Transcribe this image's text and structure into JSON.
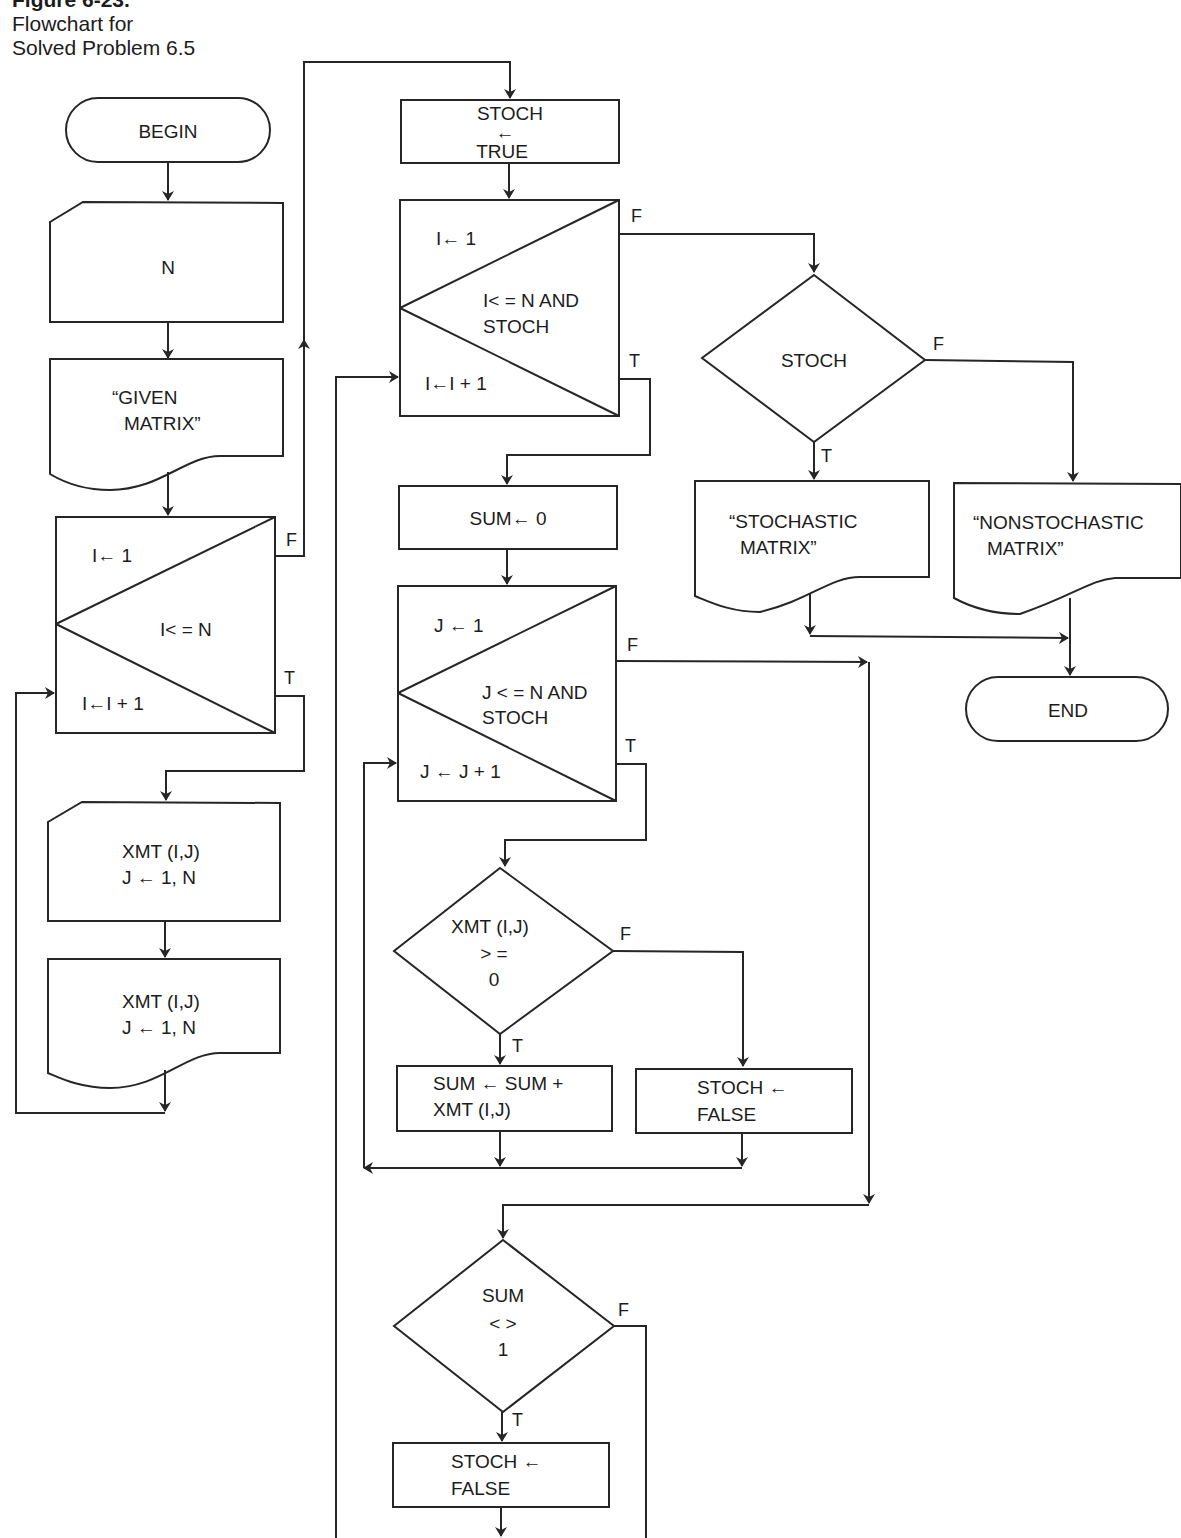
{
  "caption": {
    "figure": "Figure 6-23.",
    "line1": "Flowchart for",
    "line2": "Solved Problem 6.5"
  },
  "nodes": {
    "begin": "BEGIN",
    "input_n": "N",
    "print_given_1": "“GIVEN",
    "print_given_2": "MATRIX”",
    "loop_i_init": "I← 1",
    "loop_i_cond": "I< = N",
    "loop_i_incr": "I←I + 1",
    "read_xmt_1": "XMT (I,J)",
    "read_xmt_2": "J ← 1, N",
    "print_xmt_1": "XMT (I,J)",
    "print_xmt_2": "J ← 1, N",
    "stoch_true_1": "STOCH",
    "stoch_true_2": "←",
    "stoch_true_3": "TRUE",
    "loop_i2_init": "I← 1",
    "loop_i2_cond_1": "I< = N AND",
    "loop_i2_cond_2": "STOCH",
    "loop_i2_incr": "I←I + 1",
    "sum_zero": "SUM← 0",
    "loop_j_init": "J ← 1",
    "loop_j_cond_1": "J < = N AND",
    "loop_j_cond_2": "STOCH",
    "loop_j_incr": "J ← J + 1",
    "dec_xmt_1": "XMT (I,J)",
    "dec_xmt_2": "> =",
    "dec_xmt_3": "0",
    "sum_add_1": "SUM ← SUM +",
    "sum_add_2": "XMT (I,J)",
    "stoch_false_a_1": "STOCH ←",
    "stoch_false_a_2": "FALSE",
    "dec_sum_1": "SUM",
    "dec_sum_2": "< >",
    "dec_sum_3": "1",
    "stoch_false_b_1": "STOCH ←",
    "stoch_false_b_2": "FALSE",
    "dec_stoch": "STOCH",
    "print_stoch_1": "“STOCHASTIC",
    "print_stoch_2": "MATRIX”",
    "print_nonstoch_1": "“NONSTOCHASTIC",
    "print_nonstoch_2": "MATRIX”",
    "end": "END"
  },
  "branch_labels": {
    "true": "T",
    "false": "F"
  }
}
